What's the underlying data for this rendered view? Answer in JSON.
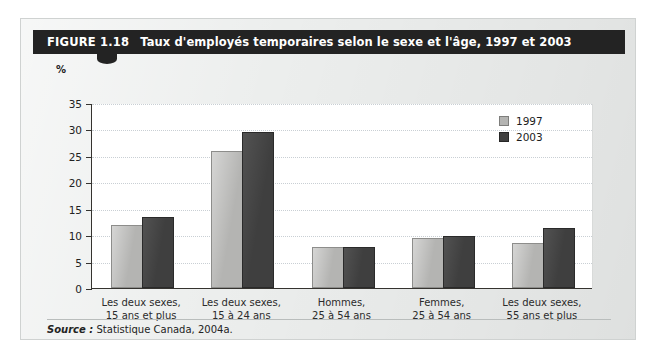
{
  "figure": {
    "number_label": "FIGURE 1.18",
    "title": "Taux d'employés temporaires selon le sexe et l'âge, 1997 et 2003",
    "source_word": "Source :",
    "source_text": "Statistique Canada, 2004a."
  },
  "colors": {
    "title_bar_bg": "#232323",
    "card_bg": "#eceeed",
    "plot_bg": "#ffffff",
    "series_1997": "#b4b4b2",
    "series_2003": "#3f3f3f",
    "axis": "#35332f",
    "gridline": "#c9cfd4"
  },
  "chart_data": {
    "type": "bar",
    "title": "Taux d'employés temporaires selon le sexe et l'âge, 1997 et 2003",
    "xlabel": "",
    "ylabel": "%",
    "ylim": [
      0,
      35
    ],
    "ytick_step": 5,
    "yticks": [
      "35",
      "30",
      "25",
      "20",
      "15",
      "10",
      "5",
      "0"
    ],
    "grid": true,
    "legend_position": "top-right",
    "categories": [
      [
        "Les deux sexes,",
        "15 ans et plus"
      ],
      [
        "Les deux sexes,",
        "15 à 24 ans"
      ],
      [
        "Hommes,",
        "25 à 54 ans"
      ],
      [
        "Femmes,",
        "25 à 54 ans"
      ],
      [
        "Les deux sexes,",
        "55 ans et plus"
      ]
    ],
    "series": [
      {
        "name": "1997",
        "color": "#b4b4b2",
        "values": [
          11.6,
          25.5,
          7.4,
          9.1,
          8.2
        ]
      },
      {
        "name": "2003",
        "color": "#3f3f3f",
        "values": [
          13.0,
          29.1,
          7.4,
          9.5,
          10.9
        ]
      }
    ]
  }
}
